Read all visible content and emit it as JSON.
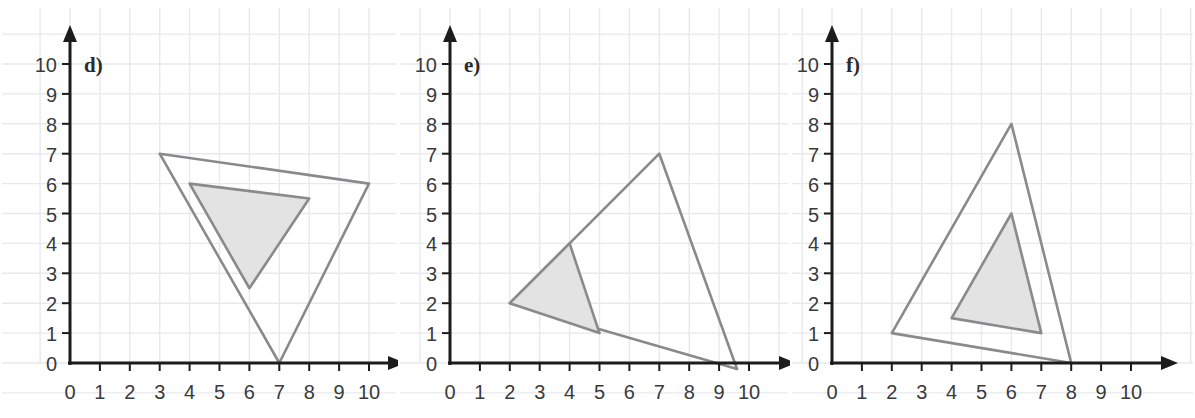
{
  "page": {
    "background_color": "#ffffff",
    "width": 1195,
    "height": 418
  },
  "style": {
    "grid_color": "#e7e9ee",
    "axis_color": "#1c1c1c",
    "shape_stroke_color": "#8a8a8a",
    "shape_fill_color": "#e3e3e3",
    "tick_label_color": "#3a3a3a",
    "panel_label_color": "#2b2b2b"
  },
  "panels": [
    {
      "id": "panel-d",
      "label": "d)",
      "axis": {
        "x_ticks": [
          "0",
          "1",
          "2",
          "3",
          "4",
          "5",
          "6",
          "7",
          "8",
          "9",
          "10"
        ],
        "y_ticks": [
          "0",
          "1",
          "2",
          "3",
          "4",
          "5",
          "6",
          "7",
          "8",
          "9",
          "10"
        ],
        "xlim": [
          0,
          10
        ],
        "ylim": [
          0,
          10
        ],
        "grid": true,
        "arrow_heads": true
      },
      "shapes": [
        {
          "name": "large-triangle",
          "fill": "none",
          "points": [
            [
              3,
              7
            ],
            [
              10,
              6
            ],
            [
              7,
              0
            ]
          ]
        },
        {
          "name": "small-triangle-shaded",
          "fill": "#e3e3e3",
          "points": [
            [
              4,
              6
            ],
            [
              8,
              5.5
            ],
            [
              6,
              2.5
            ]
          ]
        }
      ]
    },
    {
      "id": "panel-e",
      "label": "e)",
      "axis": {
        "x_ticks": [
          "0",
          "1",
          "2",
          "3",
          "4",
          "5",
          "6",
          "7",
          "8",
          "9",
          "10"
        ],
        "y_ticks": [
          "0",
          "1",
          "2",
          "3",
          "4",
          "5",
          "6",
          "7",
          "8",
          "9",
          "10"
        ],
        "xlim": [
          0,
          10
        ],
        "ylim": [
          0,
          10
        ],
        "grid": true,
        "arrow_heads": true
      },
      "shapes": [
        {
          "name": "large-triangle",
          "fill": "none",
          "points": [
            [
              2,
              2
            ],
            [
              7,
              7
            ],
            [
              9.6,
              -0.2
            ]
          ]
        },
        {
          "name": "small-triangle-shaded",
          "fill": "#e3e3e3",
          "points": [
            [
              2,
              2
            ],
            [
              4,
              4
            ],
            [
              5,
              1
            ]
          ]
        }
      ]
    },
    {
      "id": "panel-f",
      "label": "f)",
      "axis": {
        "x_ticks": [
          "0",
          "1",
          "2",
          "3",
          "4",
          "5",
          "6",
          "7",
          "8",
          "9",
          "10"
        ],
        "y_ticks": [
          "0",
          "1",
          "2",
          "3",
          "4",
          "5",
          "6",
          "7",
          "8",
          "9",
          "10"
        ],
        "xlim": [
          0,
          10
        ],
        "ylim": [
          0,
          10
        ],
        "grid": true,
        "arrow_heads": true
      },
      "shapes": [
        {
          "name": "large-triangle",
          "fill": "none",
          "points": [
            [
              2,
              1
            ],
            [
              6,
              8
            ],
            [
              8,
              0
            ]
          ]
        },
        {
          "name": "small-triangle-shaded",
          "fill": "#e3e3e3",
          "points": [
            [
              4,
              1.5
            ],
            [
              6,
              5
            ],
            [
              7,
              1
            ]
          ]
        }
      ]
    }
  ],
  "chart_data": {
    "type": "scatter",
    "title": "",
    "xlabel": "",
    "ylabel": "",
    "xlim": [
      0,
      10
    ],
    "ylim": [
      0,
      10
    ],
    "grid": true,
    "legend": "none",
    "panels": [
      {
        "label": "d)",
        "series": [
          {
            "name": "large triangle",
            "filled": false,
            "x": [
              3,
              10,
              7
            ],
            "y": [
              7,
              6,
              0
            ]
          },
          {
            "name": "small triangle",
            "filled": true,
            "x": [
              4,
              8,
              6
            ],
            "y": [
              6,
              5.5,
              2.5
            ]
          }
        ]
      },
      {
        "label": "e)",
        "series": [
          {
            "name": "large triangle",
            "filled": false,
            "x": [
              2,
              7,
              9.6
            ],
            "y": [
              2,
              7,
              -0.2
            ]
          },
          {
            "name": "small triangle",
            "filled": true,
            "x": [
              2,
              4,
              5
            ],
            "y": [
              2,
              4,
              1
            ]
          }
        ]
      },
      {
        "label": "f)",
        "series": [
          {
            "name": "large triangle",
            "filled": false,
            "x": [
              2,
              6,
              8
            ],
            "y": [
              1,
              8,
              0
            ]
          },
          {
            "name": "small triangle",
            "filled": true,
            "x": [
              4,
              6,
              7
            ],
            "y": [
              1.5,
              5,
              1
            ]
          }
        ]
      }
    ]
  }
}
